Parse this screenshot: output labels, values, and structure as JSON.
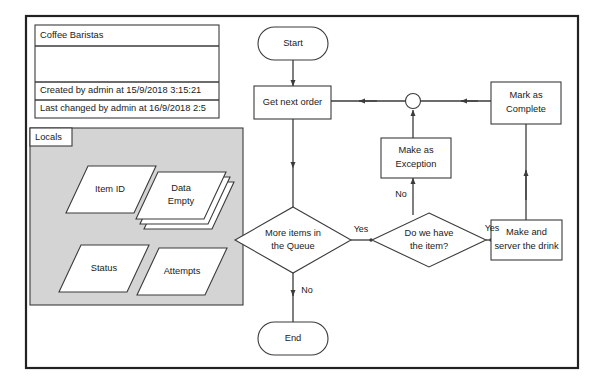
{
  "diagram": {
    "title_card": {
      "name": "Coffee Baristas",
      "created_line": "Created by admin at 15/9/2018 3:15:21",
      "changed_line": "Last changed by admin at 16/9/2018 2:5"
    },
    "locals_panel": {
      "tag_label": "Locals",
      "background_color": "#d4d4d4",
      "variables": [
        {
          "label_line1": "Item ID",
          "label_line2": ""
        },
        {
          "label_line1": "Data",
          "label_line2": "Empty",
          "stacked": "3"
        },
        {
          "label_line1": "Status",
          "label_line2": ""
        },
        {
          "label_line1": "Attempts",
          "label_line2": ""
        }
      ]
    },
    "flow": {
      "nodes": [
        {
          "id": "start",
          "type": "terminator",
          "label_line1": "Start",
          "label_line2": ""
        },
        {
          "id": "get-next-order",
          "type": "process",
          "label_line1": "Get next order",
          "label_line2": ""
        },
        {
          "id": "merge",
          "type": "connector",
          "label_line1": "",
          "label_line2": ""
        },
        {
          "id": "mark-as-complete",
          "type": "process",
          "label_line1": "Mark as",
          "label_line2": "Complete"
        },
        {
          "id": "make-as-exception",
          "type": "process",
          "label_line1": "Make as",
          "label_line2": "Exception"
        },
        {
          "id": "more-items-in-the-queue",
          "type": "decision",
          "label_line1": "More items in",
          "label_line2": "the Queue"
        },
        {
          "id": "do-we-have-the-item",
          "type": "decision",
          "label_line1": "Do we have",
          "label_line2": "the item?"
        },
        {
          "id": "make-and-server-the-drink",
          "type": "process",
          "label_line1": "Make and",
          "label_line2": "server the drink"
        },
        {
          "id": "end",
          "type": "terminator",
          "label_line1": "End",
          "label_line2": ""
        }
      ],
      "edge_labels": {
        "queue_yes": "Yes",
        "queue_no": "No",
        "item_yes": "Yes",
        "item_no": "No"
      }
    },
    "colors": {
      "stroke": "#3b3b3b",
      "frame": "#222222",
      "panel_fill": "#d4d4d4",
      "shape_fill": "#ffffff"
    }
  }
}
